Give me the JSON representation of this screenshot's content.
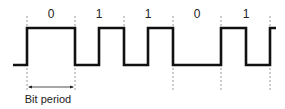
{
  "diagram": {
    "bits": [
      "0",
      "1",
      "1",
      "0",
      "1"
    ],
    "caption": "Bit period",
    "colors": {
      "signal": "#111111",
      "guide": "#999999",
      "text": "#222222"
    }
  }
}
